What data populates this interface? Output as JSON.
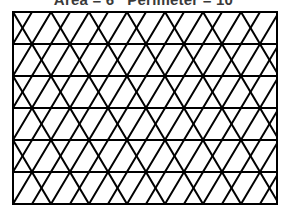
{
  "figure": {
    "caption": "Area = 6   Perimeter = 10",
    "caption_parts": {
      "area_label": "Area =",
      "area_value": "6",
      "perimeter_label": "Perimeter =",
      "perimeter_value": "10"
    },
    "background_color": "#ffffff",
    "line_color": "#000000",
    "line_width": 2,
    "border_width": 2
  },
  "chart_data": {
    "type": "diagram",
    "title": "Area = 6   Perimeter = 10",
    "frame": {
      "x": 13,
      "y": 12,
      "width": 264,
      "height": 192,
      "right": 277,
      "bottom": 204
    },
    "grid": {
      "rows": 6,
      "row_height": 32,
      "cell_width": 38,
      "half_cell_width": 19,
      "columns_per_row": 7,
      "horizontal_line_y": [
        12,
        44,
        76,
        108,
        140,
        172,
        204
      ],
      "apex_spacing": 38,
      "row_offsets": [
        0,
        19,
        0,
        19,
        0,
        19
      ],
      "triangles_total": 84,
      "pattern": "alternating up and down triangles per row, offset by half cell each row"
    },
    "xlabel": "",
    "ylabel": "",
    "grid_on": true,
    "legend": "none"
  }
}
